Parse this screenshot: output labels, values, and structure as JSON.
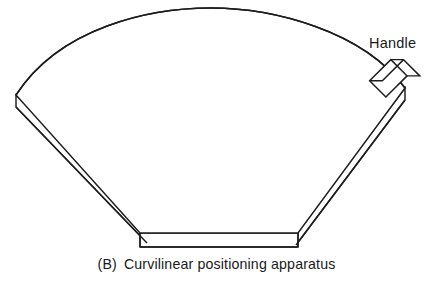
{
  "figure": {
    "caption_letter": "(B)",
    "caption_text": "Curvilinear positioning apparatus",
    "caption_full": "(B)  Curvilinear positioning apparatus",
    "line_color": "#1d1d1d",
    "fill_color": "#ffffff",
    "background_color": "#ffffff",
    "text_color": "#1a1a1a"
  },
  "labels": {
    "handle": "Handle"
  },
  "parts": {
    "plate_name": "curved-sector-plate",
    "handle_name": "handle-block",
    "arc_name": "plate-top-arc-edge",
    "bottom_name": "plate-bottom-straight-edge"
  },
  "geometry": {
    "view": "isometric-slab",
    "plate_top_arc": {
      "left_vertex": [
        16,
        95
      ],
      "apex": [
        210,
        8
      ],
      "right_vertex": [
        405,
        88
      ]
    },
    "plate_thickness_px": 12,
    "bottom_face": {
      "left": [
        140,
        233
      ],
      "right": [
        298,
        233
      ],
      "depth_px": 14
    },
    "handle_center": [
      388,
      78
    ],
    "handle_rotation_deg": 45,
    "handle_size_px": [
      30,
      22
    ]
  }
}
